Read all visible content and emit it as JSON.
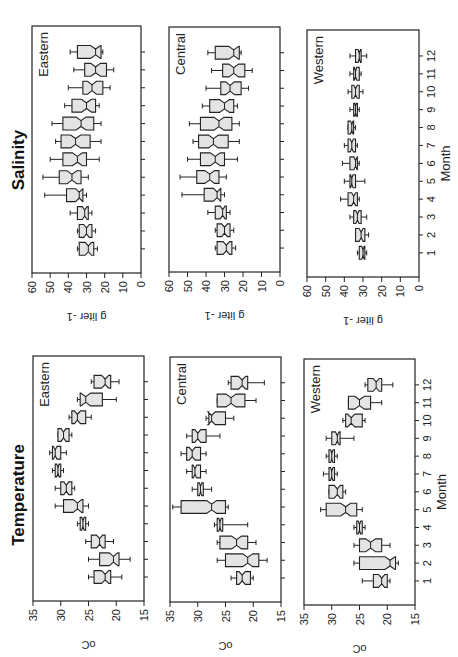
{
  "chart_data": [
    {
      "type": "boxplot",
      "title": "Salinity",
      "panel": "Eastern",
      "xlabel": "Month",
      "ylabel": "g liter -1",
      "ylim": [
        0,
        60
      ],
      "yticks": [
        0,
        10,
        20,
        30,
        40,
        50,
        60
      ],
      "categories": [
        "1",
        "2",
        "3",
        "4",
        "5",
        "6",
        "7",
        "8",
        "9",
        "10",
        "11",
        "12"
      ],
      "series": [
        {
          "month": 1,
          "min": 24,
          "q1": 26,
          "median": 29,
          "q3": 34,
          "max": 35
        },
        {
          "month": 2,
          "min": 25,
          "q1": 27,
          "median": 30,
          "q3": 34,
          "max": 35
        },
        {
          "month": 3,
          "min": 27,
          "q1": 29,
          "median": 31,
          "q3": 35,
          "max": 39
        },
        {
          "month": 4,
          "min": 30,
          "q1": 32,
          "median": 34,
          "q3": 41,
          "max": 53
        },
        {
          "month": 5,
          "min": 29,
          "q1": 33,
          "median": 38,
          "q3": 45,
          "max": 54
        },
        {
          "month": 6,
          "min": 23,
          "q1": 30,
          "median": 35,
          "q3": 43,
          "max": 50
        },
        {
          "month": 7,
          "min": 22,
          "q1": 28,
          "median": 36,
          "q3": 44,
          "max": 47
        },
        {
          "month": 8,
          "min": 22,
          "q1": 26,
          "median": 33,
          "q3": 43,
          "max": 49
        },
        {
          "month": 9,
          "min": 23,
          "q1": 25,
          "median": 30,
          "q3": 38,
          "max": 42
        },
        {
          "month": 10,
          "min": 17,
          "q1": 21,
          "median": 27,
          "q3": 32,
          "max": 40
        },
        {
          "month": 11,
          "min": 15,
          "q1": 19,
          "median": 25,
          "q3": 31,
          "max": 37
        },
        {
          "month": 12,
          "min": 21,
          "q1": 22,
          "median": 25,
          "q3": 35,
          "max": 39
        }
      ]
    },
    {
      "type": "boxplot",
      "title": "Salinity",
      "panel": "Central",
      "xlabel": "Month",
      "ylabel": "g liter -1",
      "ylim": [
        0,
        60
      ],
      "yticks": [
        0,
        10,
        20,
        30,
        40,
        50,
        60
      ],
      "categories": [
        "1",
        "2",
        "3",
        "4",
        "5",
        "6",
        "7",
        "8",
        "9",
        "10",
        "11",
        "12"
      ],
      "series": [
        {
          "month": 1,
          "min": 24,
          "q1": 26,
          "median": 29,
          "q3": 34,
          "max": 35
        },
        {
          "month": 2,
          "min": 25,
          "q1": 27,
          "median": 30,
          "q3": 34,
          "max": 35
        },
        {
          "month": 3,
          "min": 27,
          "q1": 29,
          "median": 31,
          "q3": 35,
          "max": 39
        },
        {
          "month": 4,
          "min": 30,
          "q1": 32,
          "median": 34,
          "q3": 41,
          "max": 53
        },
        {
          "month": 5,
          "min": 29,
          "q1": 33,
          "median": 38,
          "q3": 45,
          "max": 54
        },
        {
          "month": 6,
          "min": 23,
          "q1": 30,
          "median": 35,
          "q3": 43,
          "max": 50
        },
        {
          "month": 7,
          "min": 22,
          "q1": 28,
          "median": 36,
          "q3": 44,
          "max": 47
        },
        {
          "month": 8,
          "min": 22,
          "q1": 26,
          "median": 33,
          "q3": 43,
          "max": 49
        },
        {
          "month": 9,
          "min": 23,
          "q1": 25,
          "median": 30,
          "q3": 38,
          "max": 42
        },
        {
          "month": 10,
          "min": 17,
          "q1": 21,
          "median": 27,
          "q3": 32,
          "max": 40
        },
        {
          "month": 11,
          "min": 15,
          "q1": 19,
          "median": 25,
          "q3": 31,
          "max": 37
        },
        {
          "month": 12,
          "min": 21,
          "q1": 22,
          "median": 25,
          "q3": 35,
          "max": 39
        }
      ]
    },
    {
      "type": "boxplot",
      "title": "Salinity",
      "panel": "Western",
      "xlabel": "Month",
      "ylabel": "g liter -1",
      "ylim": [
        0,
        60
      ],
      "yticks": [
        0,
        10,
        20,
        30,
        40,
        50,
        60
      ],
      "categories": [
        "1",
        "2",
        "3",
        "4",
        "5",
        "6",
        "7",
        "8",
        "9",
        "10",
        "11",
        "12"
      ],
      "series": [
        {
          "month": 1,
          "min": 28,
          "q1": 29,
          "median": 30,
          "q3": 32,
          "max": 33
        },
        {
          "month": 2,
          "min": 27,
          "q1": 29,
          "median": 31,
          "q3": 34,
          "max": 34
        },
        {
          "month": 3,
          "min": 28,
          "q1": 31,
          "median": 33,
          "q3": 35,
          "max": 37
        },
        {
          "month": 4,
          "min": 32,
          "q1": 33,
          "median": 35,
          "q3": 38,
          "max": 42
        },
        {
          "month": 5,
          "min": 29,
          "q1": 34,
          "median": 36,
          "q3": 37,
          "max": 40
        },
        {
          "month": 6,
          "min": 32,
          "q1": 33,
          "median": 34,
          "q3": 37,
          "max": 41
        },
        {
          "month": 7,
          "min": 33,
          "q1": 34,
          "median": 36,
          "q3": 38,
          "max": 40
        },
        {
          "month": 8,
          "min": 34,
          "q1": 35,
          "median": 36,
          "q3": 38,
          "max": 38
        },
        {
          "month": 9,
          "min": 32,
          "q1": 33,
          "median": 34,
          "q3": 35,
          "max": 37
        },
        {
          "month": 10,
          "min": 30,
          "q1": 32,
          "median": 34,
          "q3": 36,
          "max": 38
        },
        {
          "month": 11,
          "min": 31,
          "q1": 32,
          "median": 34,
          "q3": 35,
          "max": 37
        },
        {
          "month": 12,
          "min": 28,
          "q1": 31,
          "median": 32,
          "q3": 34,
          "max": 37
        }
      ]
    },
    {
      "type": "boxplot",
      "title": "Temperature",
      "panel": "Eastern",
      "xlabel": "Month",
      "ylabel": "oC",
      "ylim": [
        15,
        35
      ],
      "yticks": [
        15,
        20,
        25,
        30,
        35
      ],
      "categories": [
        "1",
        "2",
        "3",
        "4",
        "5",
        "6",
        "7",
        "8",
        "9",
        "10",
        "11",
        "12"
      ],
      "series": [
        {
          "month": 1,
          "min": 19,
          "q1": 21,
          "median": 22,
          "q3": 24,
          "max": 25
        },
        {
          "month": 2,
          "min": 17.5,
          "q1": 19.5,
          "median": 20.5,
          "q3": 23,
          "max": 25
        },
        {
          "month": 3,
          "min": 20.5,
          "q1": 22,
          "median": 23,
          "q3": 24.5,
          "max": 25.5
        },
        {
          "month": 4,
          "min": 25,
          "q1": 25.5,
          "median": 26,
          "q3": 26.5,
          "max": 27
        },
        {
          "month": 5,
          "min": 25,
          "q1": 26,
          "median": 27,
          "q3": 29.5,
          "max": 31
        },
        {
          "month": 6,
          "min": 27.5,
          "q1": 28,
          "median": 29,
          "q3": 30,
          "max": 31
        },
        {
          "month": 7,
          "min": 29.5,
          "q1": 30,
          "median": 30.5,
          "q3": 31,
          "max": 31.5
        },
        {
          "month": 8,
          "min": 29,
          "q1": 30,
          "median": 31,
          "q3": 31.5,
          "max": 32
        },
        {
          "month": 9,
          "min": 28,
          "q1": 28.5,
          "median": 29.5,
          "q3": 30.5,
          "max": 30.5
        },
        {
          "month": 10,
          "min": 24.5,
          "q1": 25.5,
          "median": 27,
          "q3": 28,
          "max": 28.5
        },
        {
          "month": 11,
          "min": 20,
          "q1": 22.5,
          "median": 25.5,
          "q3": 26.5,
          "max": 27
        },
        {
          "month": 12,
          "min": 19.5,
          "q1": 21,
          "median": 22,
          "q3": 24,
          "max": 24.5
        }
      ]
    },
    {
      "type": "boxplot",
      "title": "Temperature",
      "panel": "Central",
      "xlabel": "Month",
      "ylabel": "oC",
      "ylim": [
        15,
        35
      ],
      "yticks": [
        15,
        20,
        25,
        30,
        35
      ],
      "categories": [
        "1",
        "2",
        "3",
        "4",
        "5",
        "6",
        "7",
        "8",
        "9",
        "10",
        "11",
        "12"
      ],
      "series": [
        {
          "month": 1,
          "min": 20,
          "q1": 20.5,
          "median": 22,
          "q3": 23,
          "max": 24
        },
        {
          "month": 2,
          "min": 17.5,
          "q1": 19,
          "median": 21,
          "q3": 25,
          "max": 26.5
        },
        {
          "month": 3,
          "min": 19.5,
          "q1": 21,
          "median": 23,
          "q3": 26,
          "max": 26.5
        },
        {
          "month": 4,
          "min": 21,
          "q1": 25.5,
          "median": 26,
          "q3": 26.5,
          "max": 27
        },
        {
          "month": 5,
          "min": 24.5,
          "q1": 25,
          "median": 27.5,
          "q3": 33,
          "max": 34.5
        },
        {
          "month": 6,
          "min": 27.5,
          "q1": 29,
          "median": 29.5,
          "q3": 30,
          "max": 31
        },
        {
          "month": 7,
          "min": 28.5,
          "q1": 29.5,
          "median": 30.5,
          "q3": 31,
          "max": 32
        },
        {
          "month": 8,
          "min": 28.5,
          "q1": 29.5,
          "median": 31,
          "q3": 32,
          "max": 33
        },
        {
          "month": 9,
          "min": 26,
          "q1": 28.5,
          "median": 30,
          "q3": 31,
          "max": 32
        },
        {
          "month": 10,
          "min": 23.5,
          "q1": 25,
          "median": 27.5,
          "q3": 28,
          "max": 28.5
        },
        {
          "month": 11,
          "min": 19.5,
          "q1": 21.5,
          "median": 24,
          "q3": 26.5,
          "max": 26.5
        },
        {
          "month": 12,
          "min": 18,
          "q1": 21,
          "median": 22,
          "q3": 24,
          "max": 24.5
        }
      ]
    },
    {
      "type": "boxplot",
      "title": "Temperature",
      "panel": "Western",
      "xlabel": "Month",
      "ylabel": "oC",
      "ylim": [
        15,
        35
      ],
      "yticks": [
        15,
        20,
        25,
        30,
        35
      ],
      "categories": [
        "1",
        "2",
        "3",
        "4",
        "5",
        "6",
        "7",
        "8",
        "9",
        "10",
        "11",
        "12"
      ],
      "series": [
        {
          "month": 1,
          "min": 19.5,
          "q1": 20,
          "median": 21,
          "q3": 22.5,
          "max": 24.5
        },
        {
          "month": 2,
          "min": 18,
          "q1": 18.5,
          "median": 19.5,
          "q3": 25,
          "max": 26
        },
        {
          "month": 3,
          "min": 19.5,
          "q1": 21,
          "median": 23,
          "q3": 25,
          "max": 26
        },
        {
          "month": 4,
          "min": 24,
          "q1": 24.5,
          "median": 25,
          "q3": 25.5,
          "max": 26
        },
        {
          "month": 5,
          "min": 24.5,
          "q1": 25.5,
          "median": 27.5,
          "q3": 31,
          "max": 32
        },
        {
          "month": 6,
          "min": 27.5,
          "q1": 28,
          "median": 29,
          "q3": 30.5,
          "max": 30.5
        },
        {
          "month": 7,
          "min": 29,
          "q1": 29.5,
          "median": 30,
          "q3": 30.5,
          "max": 31.5
        },
        {
          "month": 8,
          "min": 29,
          "q1": 29.5,
          "median": 30,
          "q3": 30.5,
          "max": 31
        },
        {
          "month": 9,
          "min": 26,
          "q1": 28.5,
          "median": 29,
          "q3": 30,
          "max": 31
        },
        {
          "month": 10,
          "min": 24,
          "q1": 24.5,
          "median": 26.5,
          "q3": 27.5,
          "max": 28
        },
        {
          "month": 11,
          "min": 21,
          "q1": 23,
          "median": 25,
          "q3": 27,
          "max": 27
        },
        {
          "month": 12,
          "min": 19,
          "q1": 21,
          "median": 22,
          "q3": 23.5,
          "max": 24
        }
      ]
    }
  ],
  "figure": {
    "salinity_title": "Salinity",
    "temperature_title": "Temperature",
    "salinity_unit": "g liter",
    "salinity_unit_exp": "-1",
    "temperature_unit": "oC",
    "month_label": "Month",
    "panel_labels": [
      "Eastern",
      "Central",
      "Western"
    ]
  }
}
